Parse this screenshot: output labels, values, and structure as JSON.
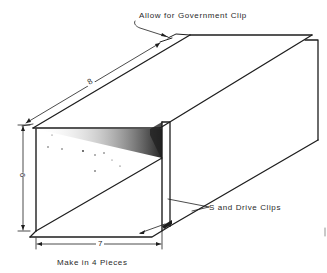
{
  "diagram": {
    "type": "isometric duct section drawing",
    "annotations": {
      "government_clip": "Allow for Government Clip",
      "s_drive_clips": "S and Drive Clips",
      "pieces": "Make in 4 Pieces"
    },
    "dimensions": {
      "length": "8",
      "height": "6",
      "width": "7"
    },
    "colors": {
      "line": "#1e1e1e",
      "background": "#ffffff"
    }
  }
}
